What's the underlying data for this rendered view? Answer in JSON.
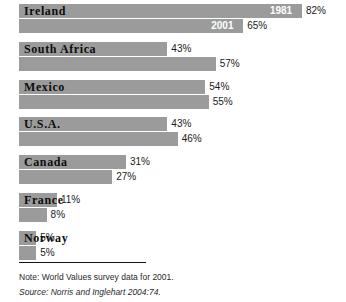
{
  "chart_data": {
    "type": "bar",
    "title": "",
    "xlabel": "",
    "ylabel": "",
    "orientation": "horizontal",
    "grid": false,
    "legend_position": "in-bar",
    "xlim": [
      0,
      100
    ],
    "unit": "%",
    "categories": [
      "Ireland",
      "South Africa",
      "Mexico",
      "U.S.A.",
      "Canada",
      "France",
      "Norway"
    ],
    "series": [
      {
        "name": "1981",
        "values": [
          82,
          43,
          54,
          43,
          31,
          11,
          5
        ]
      },
      {
        "name": "2001",
        "values": [
          65,
          57,
          55,
          46,
          27,
          8,
          5
        ]
      }
    ],
    "rows": [
      {
        "category": "Ireland",
        "first": {
          "year": "1981",
          "value": 82,
          "label": "82%",
          "show_year_in_bar": true
        },
        "second": {
          "year": "2001",
          "value": 65,
          "label": "65%",
          "show_year_in_bar": true
        }
      },
      {
        "category": "South Africa",
        "first": {
          "year": "1981",
          "value": 43,
          "label": "43%",
          "show_year_in_bar": false
        },
        "second": {
          "year": "2001",
          "value": 57,
          "label": "57%",
          "show_year_in_bar": false
        }
      },
      {
        "category": "Mexico",
        "first": {
          "year": "1981",
          "value": 54,
          "label": "54%",
          "show_year_in_bar": false
        },
        "second": {
          "year": "2001",
          "value": 55,
          "label": "55%",
          "show_year_in_bar": false
        }
      },
      {
        "category": "U.S.A.",
        "first": {
          "year": "1981",
          "value": 43,
          "label": "43%",
          "show_year_in_bar": false
        },
        "second": {
          "year": "2001",
          "value": 46,
          "label": "46%",
          "show_year_in_bar": false
        }
      },
      {
        "category": "Canada",
        "first": {
          "year": "1981",
          "value": 31,
          "label": "31%",
          "show_year_in_bar": false
        },
        "second": {
          "year": "2001",
          "value": 27,
          "label": "27%",
          "show_year_in_bar": false
        }
      },
      {
        "category": "France",
        "first": {
          "year": "1981",
          "value": 11,
          "label": "11%",
          "show_year_in_bar": false
        },
        "second": {
          "year": "2001",
          "value": 8,
          "label": "8%",
          "show_year_in_bar": false
        }
      },
      {
        "category": "Norway",
        "first": {
          "year": "1981",
          "value": 5,
          "label": "5%",
          "show_year_in_bar": false
        },
        "second": {
          "year": "2001",
          "value": 5,
          "label": "5%",
          "show_year_in_bar": false
        }
      }
    ],
    "colors": {
      "bar": "#9b9b9b",
      "text": "#1a1a1a",
      "category_text": "#0d0d0d",
      "year_text": "#ffffff",
      "background": "#ffffff",
      "rule": "#111111"
    }
  },
  "footer": {
    "note": "Note: World Values survey data for 2001.",
    "source": "Source: Norris and Inglehart 2004:74."
  }
}
